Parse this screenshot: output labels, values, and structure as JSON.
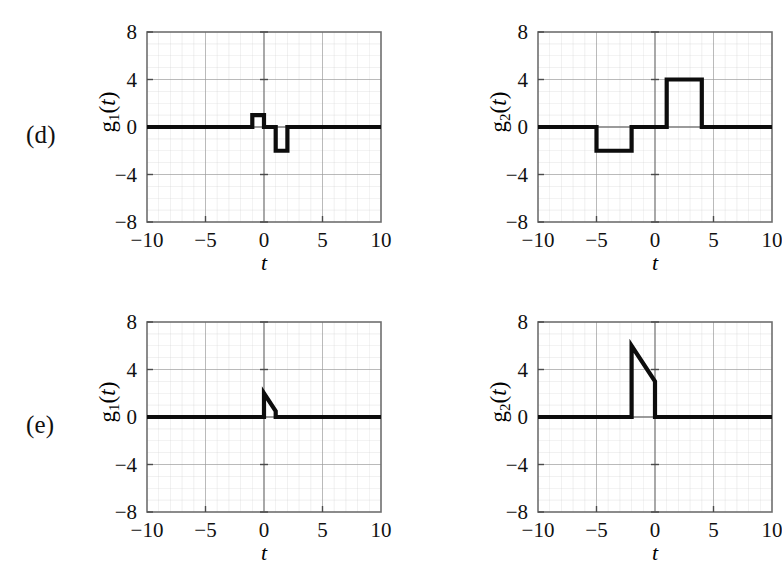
{
  "figure": {
    "background": "#ffffff",
    "signal_color": "#0d0d0d",
    "grid_color": "#c9c9c9",
    "axis_color": "#6f6f6f",
    "rows": [
      {
        "label": "(d)"
      },
      {
        "label": "(e)"
      }
    ]
  },
  "axes": {
    "x_ticks": [
      "−10",
      "−5",
      "0",
      "5",
      "10"
    ],
    "x_tick_values": [
      -10,
      -5,
      0,
      5,
      10
    ],
    "y_ticks": [
      "8",
      "4",
      "0",
      "−4",
      "−8"
    ],
    "y_tick_values": [
      8,
      4,
      0,
      -4,
      -8
    ],
    "xlabel": "t",
    "xlim": [
      -10,
      10
    ],
    "ylim": [
      -8,
      8
    ],
    "minor_step_x": 1,
    "minor_step_y": 1
  },
  "panels": {
    "d1": {
      "ylabel_fn": "g",
      "ylabel_sub": "1",
      "ylabel_var": "t",
      "ylabel_text": "g₁(t)"
    },
    "d2": {
      "ylabel_fn": "g",
      "ylabel_sub": "2",
      "ylabel_var": "t",
      "ylabel_text": "g₂(t)"
    },
    "e1": {
      "ylabel_fn": "g",
      "ylabel_sub": "1",
      "ylabel_var": "t",
      "ylabel_text": "g₁(t)"
    },
    "e2": {
      "ylabel_fn": "g",
      "ylabel_sub": "2",
      "ylabel_var": "t",
      "ylabel_text": "g₂(t)"
    }
  },
  "chart_data": [
    {
      "id": "d1",
      "type": "line",
      "row": "(d)",
      "position": "left",
      "title": "",
      "xlabel": "t",
      "ylabel": "g1(t)",
      "xlim": [
        -10,
        10
      ],
      "ylim": [
        -8,
        8
      ],
      "grid": true,
      "legend": "none",
      "description": "Piecewise-constant signal: rectangular pulse of amplitude 1 on -1<t<0, rectangular pulse of amplitude -2 on 1<t<2, zero elsewhere.",
      "points": [
        [
          -10,
          0
        ],
        [
          -1,
          0
        ],
        [
          -1,
          1
        ],
        [
          0,
          1
        ],
        [
          0,
          0
        ],
        [
          1,
          0
        ],
        [
          1,
          -2
        ],
        [
          2,
          -2
        ],
        [
          2,
          0
        ],
        [
          10,
          0
        ]
      ]
    },
    {
      "id": "d2",
      "type": "line",
      "row": "(d)",
      "position": "right",
      "title": "",
      "xlabel": "t",
      "ylabel": "g2(t)",
      "xlim": [
        -10,
        10
      ],
      "ylim": [
        -8,
        8
      ],
      "grid": true,
      "legend": "none",
      "description": "Piecewise-constant signal: rectangular pulse of amplitude -2 on -5<t<-2, rectangular pulse of amplitude 4 on 1<t<4, zero elsewhere.",
      "points": [
        [
          -10,
          0
        ],
        [
          -5,
          0
        ],
        [
          -5,
          -2
        ],
        [
          -2,
          -2
        ],
        [
          -2,
          0
        ],
        [
          1,
          0
        ],
        [
          1,
          4
        ],
        [
          4,
          4
        ],
        [
          4,
          0
        ],
        [
          10,
          0
        ]
      ]
    },
    {
      "id": "e1",
      "type": "line",
      "row": "(e)",
      "position": "left",
      "title": "",
      "xlabel": "t",
      "ylabel": "g1(t)",
      "xlim": [
        -10,
        10
      ],
      "ylim": [
        -8,
        8
      ],
      "grid": true,
      "legend": "none",
      "description": "Zero for t<0; jumps to 2 at t=0 then decays linearly to 0.5 at t=1, then drops to 0 and stays zero.",
      "points": [
        [
          -10,
          0
        ],
        [
          0,
          0
        ],
        [
          0,
          2
        ],
        [
          1,
          0.5
        ],
        [
          1,
          0
        ],
        [
          10,
          0
        ]
      ]
    },
    {
      "id": "e2",
      "type": "line",
      "row": "(e)",
      "position": "right",
      "title": "",
      "xlabel": "t",
      "ylabel": "g2(t)",
      "xlim": [
        -10,
        10
      ],
      "ylim": [
        -8,
        8
      ],
      "grid": true,
      "legend": "none",
      "description": "Zero for t<-2; jumps to 6 at t=-2 then decays linearly to 3 at t=0, then drops to 0 and stays zero.",
      "points": [
        [
          -10,
          0
        ],
        [
          -2,
          0
        ],
        [
          -2,
          6
        ],
        [
          0,
          3
        ],
        [
          0,
          0
        ],
        [
          10,
          0
        ]
      ]
    }
  ]
}
